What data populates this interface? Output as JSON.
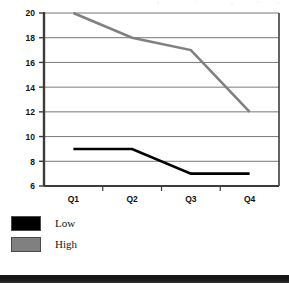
{
  "chart_data": {
    "type": "line",
    "title": "",
    "subtitle": "",
    "xlabel": "",
    "ylabel": "",
    "categories": [
      "Q1",
      "Q2",
      "Q3",
      "Q4"
    ],
    "series": [
      {
        "name": "Low",
        "values": [
          9,
          9,
          7,
          7
        ],
        "color": "#000000"
      },
      {
        "name": "High",
        "values": [
          20,
          18,
          17,
          12
        ],
        "color": "#808080"
      }
    ],
    "ylim": [
      6,
      20
    ],
    "yticks": [
      6,
      8,
      10,
      12,
      14,
      16,
      18,
      20
    ],
    "ytick_labels": [
      "6",
      "8",
      "10",
      "12",
      "14",
      "16",
      "18",
      "20"
    ],
    "grid": true,
    "grid_axis": "y",
    "legend_position": "below-left",
    "axis_color": "#3c3c3c",
    "grid_color": "#787878",
    "background": "#ffffff"
  },
  "legend": {
    "items": [
      {
        "label": "Low",
        "color": "#000000"
      },
      {
        "label": "High",
        "color": "#808080"
      }
    ]
  }
}
